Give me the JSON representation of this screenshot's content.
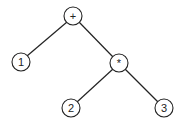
{
  "diagram": {
    "type": "expression-tree",
    "nodes": [
      {
        "id": "plus",
        "label": "+",
        "x": 73,
        "y": 16
      },
      {
        "id": "one",
        "label": "1",
        "x": 21,
        "y": 62
      },
      {
        "id": "times",
        "label": "*",
        "x": 119,
        "y": 63
      },
      {
        "id": "two",
        "label": "2",
        "x": 71,
        "y": 108
      },
      {
        "id": "three",
        "label": "3",
        "x": 164,
        "y": 108
      }
    ],
    "edges": [
      {
        "from": "plus",
        "to": "one"
      },
      {
        "from": "plus",
        "to": "times"
      },
      {
        "from": "times",
        "to": "two"
      },
      {
        "from": "times",
        "to": "three"
      }
    ]
  }
}
